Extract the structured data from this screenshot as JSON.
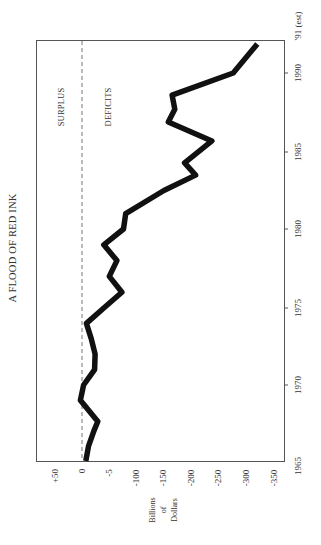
{
  "chart_data": {
    "type": "line",
    "title": "A FLOOD OF RED INK",
    "orientation": "rotated 90° counter-clockwise (years run bottom-to-top along right edge; values run left-to-right along bottom)",
    "xlabel": "",
    "ylabel": "Billions of Dollars",
    "ylabel_lines": [
      "Billions",
      "of",
      "Dollars"
    ],
    "x_ticks": [
      "1965",
      "1970",
      "1975",
      "1980",
      "1985",
      "1990",
      "'91 (est)"
    ],
    "y_ticks": [
      "+50",
      "0",
      "-5",
      "-100",
      "-150",
      "-200",
      "-250",
      "-300",
      "-350"
    ],
    "y_tick_values": [
      50,
      0,
      -50,
      -100,
      -150,
      -200,
      -250,
      -300,
      -350
    ],
    "xlim": [
      1965,
      1991
    ],
    "ylim": [
      -350,
      60
    ],
    "grid": false,
    "reference_line": {
      "value": 0,
      "style": "dashed"
    },
    "annotations": [
      "SURPLUS",
      "DEFICITS"
    ],
    "series": [
      {
        "name": "Federal budget surplus/deficit",
        "x": [
          1965,
          1966,
          1967,
          1967.6,
          1969,
          1970,
          1971,
          1972,
          1973,
          1974,
          1975,
          1976,
          1977,
          1978,
          1979,
          1980,
          1981,
          1982.5,
          1983.5,
          1984.3,
          1985.7,
          1986.9,
          1987.7,
          1988.6,
          1990,
          1991
        ],
        "values": [
          -7,
          -12,
          -22,
          -29,
          3,
          -3,
          -23,
          -24,
          -17,
          -8,
          -40,
          -73,
          -50,
          -64,
          -40,
          -76,
          -80,
          -150,
          -208,
          -188,
          -238,
          -158,
          -170,
          -165,
          -277,
          -321
        ]
      }
    ]
  },
  "labels": {
    "title": "A FLOOD OF RED INK",
    "surplus": "SURPLUS",
    "deficits": "DEFICITS",
    "unit_line1": "Billions",
    "unit_line2": "of",
    "unit_line3": "Dollars"
  },
  "value_axis": {
    "ticks": [
      {
        "label": "+50",
        "value": 50
      },
      {
        "label": "0",
        "value": 0
      },
      {
        "label": "-5",
        "value": -50
      },
      {
        "label": "-100",
        "value": -100
      },
      {
        "label": "-150",
        "value": -150
      },
      {
        "label": "-200",
        "value": -200
      },
      {
        "label": "-250",
        "value": -250
      },
      {
        "label": "-300",
        "value": -300
      },
      {
        "label": "-350",
        "value": -350
      }
    ]
  },
  "year_axis": {
    "ticks": [
      {
        "label": "1965",
        "year": 1965
      },
      {
        "label": "1970",
        "year": 1970
      },
      {
        "label": "1975",
        "year": 1975
      },
      {
        "label": "1980",
        "year": 1980
      },
      {
        "label": "1985",
        "year": 1985
      },
      {
        "label": "1990",
        "year": 1990
      },
      {
        "label": "'91 (est)",
        "year": 1991
      }
    ]
  },
  "colors": {
    "line": "#111111",
    "frame": "#555555",
    "dashed": "#777777",
    "text": "#333333",
    "background": "#ffffff"
  }
}
